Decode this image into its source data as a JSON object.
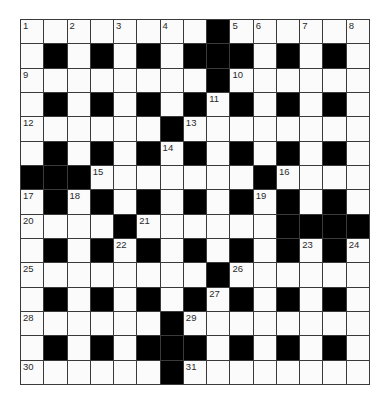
{
  "puzzle": {
    "type": "crossword",
    "rows": 15,
    "cols": 15,
    "colors": {
      "block": "#000000",
      "cell": "#fbfbfb",
      "gridline": "#3a3a3a",
      "number": "#2a2a2a"
    },
    "layout": [
      "..............#",
      "x"
    ],
    "grid": [
      "........#......",
      ".#.#.#.###.#.#.",
      "........#......",
      ".#.#.#.#.#.#.#.",
      "......#........",
      ".#.#.#.#.#.#.#.",
      "###.......#....",
      ".#.#.#.#.#.#.#.",
      "....#......####",
      ".#.#.#.#.#.#.#.",
      "........#......",
      ".#.#.#.#.#.#.#.",
      "......#........",
      ".#.#.###.#.#.#.",
      "......#........"
    ],
    "numbers": [
      {
        "row": 0,
        "col": 0,
        "n": "1"
      },
      {
        "row": 0,
        "col": 2,
        "n": "2"
      },
      {
        "row": 0,
        "col": 4,
        "n": "3"
      },
      {
        "row": 0,
        "col": 6,
        "n": "4"
      },
      {
        "row": 0,
        "col": 9,
        "n": "5"
      },
      {
        "row": 0,
        "col": 10,
        "n": "6"
      },
      {
        "row": 0,
        "col": 12,
        "n": "7"
      },
      {
        "row": 0,
        "col": 14,
        "n": "8"
      },
      {
        "row": 2,
        "col": 0,
        "n": "9"
      },
      {
        "row": 2,
        "col": 9,
        "n": "10"
      },
      {
        "row": 3,
        "col": 8,
        "n": "11"
      },
      {
        "row": 4,
        "col": 0,
        "n": "12"
      },
      {
        "row": 4,
        "col": 7,
        "n": "13"
      },
      {
        "row": 5,
        "col": 6,
        "n": "14"
      },
      {
        "row": 6,
        "col": 3,
        "n": "15"
      },
      {
        "row": 6,
        "col": 11,
        "n": "16"
      },
      {
        "row": 7,
        "col": 0,
        "n": "17"
      },
      {
        "row": 7,
        "col": 2,
        "n": "18"
      },
      {
        "row": 7,
        "col": 10,
        "n": "19"
      },
      {
        "row": 8,
        "col": 0,
        "n": "20"
      },
      {
        "row": 8,
        "col": 5,
        "n": "21"
      },
      {
        "row": 9,
        "col": 4,
        "n": "22"
      },
      {
        "row": 9,
        "col": 12,
        "n": "23"
      },
      {
        "row": 9,
        "col": 14,
        "n": "24"
      },
      {
        "row": 10,
        "col": 0,
        "n": "25"
      },
      {
        "row": 10,
        "col": 9,
        "n": "26"
      },
      {
        "row": 11,
        "col": 8,
        "n": "27"
      },
      {
        "row": 12,
        "col": 0,
        "n": "28"
      },
      {
        "row": 12,
        "col": 7,
        "n": "29"
      },
      {
        "row": 14,
        "col": 0,
        "n": "30"
      },
      {
        "row": 14,
        "col": 7,
        "n": "31"
      }
    ],
    "entries": {}
  }
}
